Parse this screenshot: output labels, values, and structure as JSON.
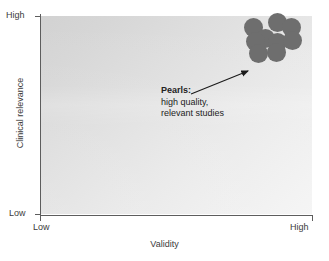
{
  "chart_data": {
    "type": "scatter",
    "title": "",
    "xlabel": "Validity",
    "ylabel": "Clinical relevance",
    "xlim": [
      "Low",
      "High"
    ],
    "ylim": [
      "Low",
      "High"
    ],
    "x_tick_labels": [
      "Low",
      "High"
    ],
    "y_tick_labels": [
      "Low",
      "High"
    ],
    "grid": false,
    "legend": "none",
    "series": [
      {
        "name": "Pearls",
        "marker": "circle",
        "color": "#6e6e6e",
        "points": [
          {
            "x": 0.79,
            "y": 0.95
          },
          {
            "x": 0.88,
            "y": 0.97
          },
          {
            "x": 0.93,
            "y": 0.94
          },
          {
            "x": 0.83,
            "y": 0.89
          },
          {
            "x": 0.8,
            "y": 0.88
          },
          {
            "x": 0.88,
            "y": 0.87
          },
          {
            "x": 0.93,
            "y": 0.88
          },
          {
            "x": 0.81,
            "y": 0.81
          },
          {
            "x": 0.87,
            "y": 0.81
          }
        ]
      }
    ],
    "annotations": [
      {
        "title": "Pearls:",
        "lines": [
          "high quality,",
          "relevant studies"
        ],
        "points_to": {
          "x": 0.79,
          "y": 0.81
        }
      }
    ]
  },
  "axes": {
    "y": {
      "title": "Clinical relevance",
      "high_label": "High",
      "low_label": "Low"
    },
    "x": {
      "title": "Validity",
      "high_label": "High",
      "low_label": "Low"
    }
  },
  "annotation": {
    "title": "Pearls:",
    "line1": "high quality,",
    "line2": "relevant studies"
  },
  "colors": {
    "dot": "#6e6e6e",
    "axis": "#5d5d5d",
    "text": "#3b3b3b",
    "annotation_text": "#232323",
    "plot_light": "#f3f3f3",
    "plot_dark": "#d2d2d2",
    "background": "#ffffff"
  },
  "dots": [
    {
      "cx": 253,
      "cy": 27,
      "r": 9.5
    },
    {
      "cx": 277,
      "cy": 22,
      "r": 9.5
    },
    {
      "cx": 291,
      "cy": 27,
      "r": 9.5
    },
    {
      "cx": 265,
      "cy": 38,
      "r": 9.5
    },
    {
      "cx": 255,
      "cy": 41,
      "r": 9.5
    },
    {
      "cx": 277,
      "cy": 42,
      "r": 9.5
    },
    {
      "cx": 292,
      "cy": 40,
      "r": 9.5
    },
    {
      "cx": 258,
      "cy": 53,
      "r": 9.5
    },
    {
      "cx": 276,
      "cy": 52,
      "r": 9.5
    }
  ]
}
